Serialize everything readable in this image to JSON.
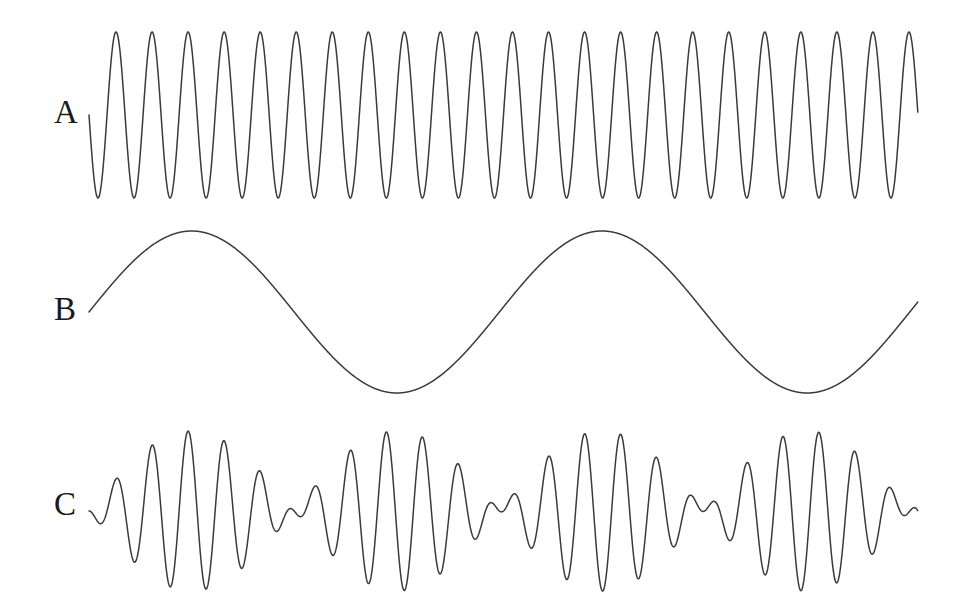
{
  "figure": {
    "background_color": "#ffffff",
    "stroke_color": "#3a3a3a",
    "stroke_width": 1.5,
    "width": 969,
    "height": 616
  },
  "panels": [
    {
      "id": "a",
      "label": "A",
      "label_x": 54,
      "label_y": 96,
      "role": "carrier",
      "description": "high-frequency sinusoid"
    },
    {
      "id": "b",
      "label": "B",
      "label_x": 54,
      "label_y": 293,
      "role": "modulator",
      "description": "low-frequency sinusoid"
    },
    {
      "id": "c",
      "label": "C",
      "label_x": 54,
      "label_y": 488,
      "role": "product",
      "description": "amplitude-modulated product of carrier and modulator"
    }
  ],
  "chart_data": {
    "type": "line",
    "title": "",
    "xlabel": "",
    "ylabel": "",
    "grid": false,
    "legend": "none",
    "axes_visible": false,
    "x_start_px": 89,
    "x_end_px": 918,
    "series": [
      {
        "name": "A",
        "panel": "a",
        "waveform": "sine",
        "baseline_px": 115,
        "amplitude_px": 83,
        "peak_px": 32,
        "trough_px": 198,
        "cycles": 23,
        "period_px": 36,
        "phase_deg": 180,
        "envelope": "constant"
      },
      {
        "name": "B",
        "panel": "b",
        "waveform": "sine",
        "baseline_px": 312,
        "amplitude_px": 81,
        "peak_px": 231,
        "trough_px": 393,
        "cycles": 2.02,
        "period_px": 410,
        "phase_deg": 0,
        "envelope": "constant"
      },
      {
        "name": "C",
        "panel": "c",
        "waveform": "sine",
        "baseline_px": 511,
        "amplitude_px": 80,
        "peak_px": 431,
        "trough_px": 591,
        "cycles": 23,
        "period_px": 36,
        "phase_deg": 180,
        "envelope": "product_of_A_and_B",
        "envelope_cycles": 2.02,
        "envelope_period_px": 410,
        "envelope_phase_deg": 0,
        "envelope_nodes_px": [
          395,
          830
        ],
        "envelope_antinodes_px": [
          197,
          605
        ]
      }
    ]
  }
}
